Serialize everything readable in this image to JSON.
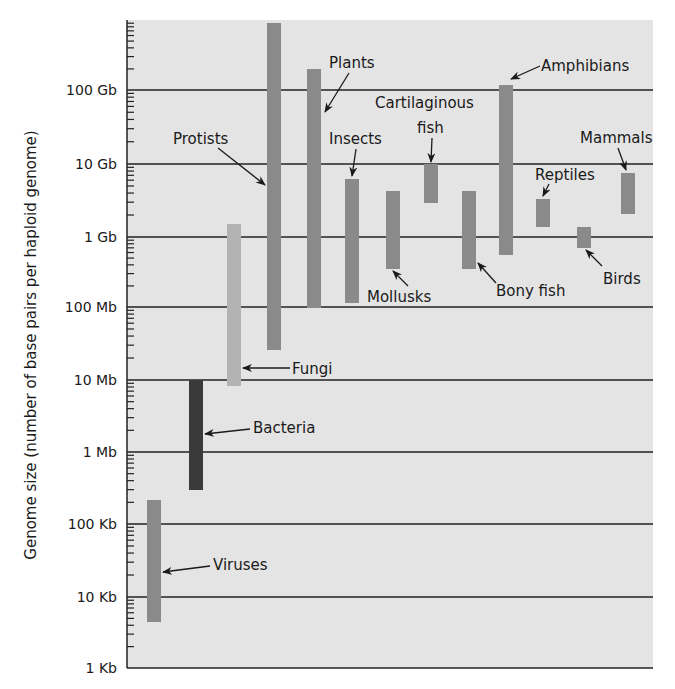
{
  "chart_data": {
    "type": "range-bar",
    "title": "",
    "ylabel": "Genome size (number of base pairs per haploid genome)",
    "xlabel": "",
    "yscale": "log10",
    "ylim_bp": [
      1000,
      1000000000000
    ],
    "y_ticks": [
      {
        "label": "1 Kb",
        "value": 1000
      },
      {
        "label": "10 Kb",
        "value": 10000
      },
      {
        "label": "100 Kb",
        "value": 100000
      },
      {
        "label": "1 Mb",
        "value": 1000000
      },
      {
        "label": "10 Mb",
        "value": 10000000
      },
      {
        "label": "100 Mb",
        "value": 100000000
      },
      {
        "label": "1 Gb",
        "value": 1000000000
      },
      {
        "label": "10 Gb",
        "value": 10000000000
      },
      {
        "label": "100 Gb",
        "value": 100000000000
      }
    ],
    "grid": true,
    "legend": "none",
    "series": [
      {
        "name": "Viruses",
        "min_bp": 4500,
        "max_bp": 220000,
        "color": "#8c8c8c"
      },
      {
        "name": "Bacteria",
        "min_bp": 300000,
        "max_bp": 10000000,
        "color": "#3a3a3a"
      },
      {
        "name": "Fungi",
        "min_bp": 8500,
        "max_bp": 1500000000,
        "color": "#b0b0b0",
        "min_note": "approx 8.5 Mb",
        "min_bp_actual": 8500000
      },
      {
        "name": "Protists",
        "min_bp": 25000000,
        "max_bp": 700000000000,
        "color": "#8a8a8a"
      },
      {
        "name": "Plants",
        "min_bp": 100000000,
        "max_bp": 190000000000,
        "color": "#8a8a8a"
      },
      {
        "name": "Insects",
        "min_bp": 120000000,
        "max_bp": 6500000000,
        "color": "#8a8a8a"
      },
      {
        "name": "Mollusks",
        "min_bp": 350000000,
        "max_bp": 4300000000,
        "color": "#8a8a8a"
      },
      {
        "name": "Cartilaginous fish",
        "min_bp": 3000000000,
        "max_bp": 10000000000,
        "color": "#8a8a8a"
      },
      {
        "name": "Bony fish",
        "min_bp": 350000000,
        "max_bp": 4300000000,
        "color": "#8a8a8a"
      },
      {
        "name": "Amphibians",
        "min_bp": 600000000,
        "max_bp": 120000000000,
        "color": "#8a8a8a"
      },
      {
        "name": "Reptiles",
        "min_bp": 1400000000,
        "max_bp": 3300000000,
        "color": "#8a8a8a"
      },
      {
        "name": "Birds",
        "min_bp": 750000000,
        "max_bp": 1400000000,
        "color": "#8a8a8a"
      },
      {
        "name": "Mammals",
        "min_bp": 2000000000,
        "max_bp": 7500000000,
        "color": "#8a8a8a"
      }
    ]
  },
  "axis": {
    "ylabel": "Genome size (number of base pairs per haploid genome)",
    "ticks": [
      "100 Gb",
      "10 Gb",
      "1 Gb",
      "100 Mb",
      "10 Mb",
      "1 Mb",
      "100 Kb",
      "10 Kb",
      "1 Kb"
    ]
  },
  "labels": {
    "viruses": "Viruses",
    "bacteria": "Bacteria",
    "fungi": "Fungi",
    "protists": "Protists",
    "plants": "Plants",
    "insects": "Insects",
    "mollusks": "Mollusks",
    "cartilaginous_1": "Cartilaginous",
    "cartilaginous_2": "fish",
    "bony_fish": "Bony fish",
    "amphibians": "Amphibians",
    "reptiles": "Reptiles",
    "birds": "Birds",
    "mammals": "Mammals"
  },
  "colors": {
    "plot_bg": "#e4e4e4",
    "bar": "#8a8a8a",
    "bar_fungi": "#b3b3b3",
    "bar_bacteria": "#3a3a3a",
    "gridline": "#222222"
  }
}
